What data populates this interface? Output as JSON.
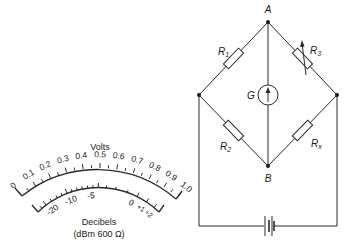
{
  "meter": {
    "title": "Volts",
    "volt_ticks": [
      "0",
      "0.1",
      "0.2",
      "0.3",
      "0.4",
      "0.5",
      "0.6",
      "0.7",
      "0.8",
      "0.9",
      "1.0"
    ],
    "db_ticks": [
      "-20",
      "-10",
      "-5",
      "0",
      "+1",
      "+2"
    ],
    "db_label": "Decibels",
    "db_sublabel": "(dBm 600 Ω)"
  },
  "bridge": {
    "node_top": "A",
    "node_bottom": "B",
    "galvanometer": "G",
    "resistors": {
      "r1": "R",
      "r1_sub": "1",
      "r2": "R",
      "r2_sub": "2",
      "r3": "R",
      "r3_sub": "3",
      "rx": "R",
      "rx_sub": "x"
    }
  },
  "colors": {
    "line": "#2a2a2a",
    "background": "#ffffff"
  }
}
